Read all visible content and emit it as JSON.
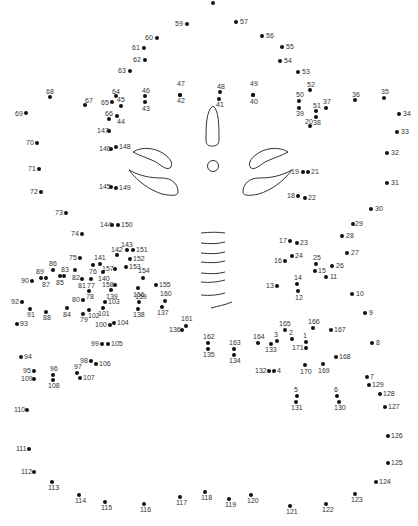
{
  "puzzle": {
    "type": "connect-the-dots",
    "line_color": "#333333",
    "dot_color": "#111111",
    "points": [
      {
        "n": "",
        "x": 213,
        "y": 3,
        "lx": 0,
        "ly": 0
      },
      {
        "n": "57",
        "x": 236,
        "y": 22,
        "lx": 4,
        "ly": -4
      },
      {
        "n": "59",
        "x": 187,
        "y": 24,
        "lx": -12,
        "ly": -4
      },
      {
        "n": "56",
        "x": 262,
        "y": 36,
        "lx": 4,
        "ly": -4
      },
      {
        "n": "60",
        "x": 157,
        "y": 38,
        "lx": -12,
        "ly": -4
      },
      {
        "n": "55",
        "x": 282,
        "y": 47,
        "lx": 4,
        "ly": -4
      },
      {
        "n": "61",
        "x": 144,
        "y": 48,
        "lx": -12,
        "ly": -4
      },
      {
        "n": "62",
        "x": 145,
        "y": 60,
        "lx": -12,
        "ly": -4
      },
      {
        "n": "54",
        "x": 280,
        "y": 61,
        "lx": 4,
        "ly": -4
      },
      {
        "n": "63",
        "x": 130,
        "y": 71,
        "lx": -12,
        "ly": -4
      },
      {
        "n": "53",
        "x": 298,
        "y": 72,
        "lx": 4,
        "ly": -4
      },
      {
        "n": "47",
        "x": 180,
        "y": 95,
        "lx": -3,
        "ly": -15
      },
      {
        "n": "42",
        "x": 180,
        "y": 95,
        "lx": -3,
        "ly": 2
      },
      {
        "n": "48",
        "x": 220,
        "y": 92,
        "lx": -3,
        "ly": -9
      },
      {
        "n": "41",
        "x": 219,
        "y": 99,
        "lx": -3,
        "ly": 2
      },
      {
        "n": "49",
        "x": 253,
        "y": 95,
        "lx": -3,
        "ly": -15
      },
      {
        "n": "40",
        "x": 253,
        "y": 95,
        "lx": -3,
        "ly": 3
      },
      {
        "n": "68",
        "x": 50,
        "y": 97,
        "lx": -4,
        "ly": -9
      },
      {
        "n": "64",
        "x": 116,
        "y": 96,
        "lx": -4,
        "ly": -8
      },
      {
        "n": "46",
        "x": 145,
        "y": 96,
        "lx": -3,
        "ly": -9
      },
      {
        "n": "43",
        "x": 145,
        "y": 102,
        "lx": -3,
        "ly": 3
      },
      {
        "n": "67",
        "x": 85,
        "y": 105,
        "lx": 0,
        "ly": -8
      },
      {
        "n": "65",
        "x": 112,
        "y": 102,
        "lx": -11,
        "ly": -3
      },
      {
        "n": "45",
        "x": 121,
        "y": 106,
        "lx": -4,
        "ly": -10
      },
      {
        "n": "66",
        "x": 109,
        "y": 119,
        "lx": -4,
        "ly": -9
      },
      {
        "n": "44",
        "x": 117,
        "y": 116,
        "lx": 0,
        "ly": 2
      },
      {
        "n": "69",
        "x": 26,
        "y": 113,
        "lx": -11,
        "ly": -3
      },
      {
        "n": "52",
        "x": 310,
        "y": 90,
        "lx": -3,
        "ly": -9
      },
      {
        "n": "50",
        "x": 299,
        "y": 101,
        "lx": -3,
        "ly": -10
      },
      {
        "n": "39",
        "x": 299,
        "y": 108,
        "lx": -3,
        "ly": 2
      },
      {
        "n": "51",
        "x": 316,
        "y": 111,
        "lx": -3,
        "ly": -9
      },
      {
        "n": "37",
        "x": 326,
        "y": 108,
        "lx": -3,
        "ly": -10
      },
      {
        "n": "36",
        "x": 355,
        "y": 100,
        "lx": -3,
        "ly": -9
      },
      {
        "n": "35",
        "x": 384,
        "y": 98,
        "lx": -3,
        "ly": -10
      },
      {
        "n": "38",
        "x": 316,
        "y": 117,
        "lx": -3,
        "ly": 2
      },
      {
        "n": "20",
        "x": 310,
        "y": 126,
        "lx": -5,
        "ly": -8
      },
      {
        "n": "34",
        "x": 399,
        "y": 114,
        "lx": 4,
        "ly": -4
      },
      {
        "n": "147",
        "x": 109,
        "y": 131,
        "lx": -12,
        "ly": -4
      },
      {
        "n": "33",
        "x": 397,
        "y": 132,
        "lx": 4,
        "ly": -4
      },
      {
        "n": "70",
        "x": 37,
        "y": 143,
        "lx": -11,
        "ly": -4
      },
      {
        "n": "146",
        "x": 111,
        "y": 149,
        "lx": -12,
        "ly": -4
      },
      {
        "n": "148",
        "x": 116,
        "y": 147,
        "lx": 3,
        "ly": -4
      },
      {
        "n": "32",
        "x": 387,
        "y": 153,
        "lx": 4,
        "ly": -4
      },
      {
        "n": "71",
        "x": 39,
        "y": 169,
        "lx": -11,
        "ly": -4
      },
      {
        "n": "19",
        "x": 303,
        "y": 172,
        "lx": -12,
        "ly": -4
      },
      {
        "n": "21",
        "x": 308,
        "y": 172,
        "lx": 3,
        "ly": -4
      },
      {
        "n": "145",
        "x": 111,
        "y": 187,
        "lx": -12,
        "ly": -4
      },
      {
        "n": "149",
        "x": 116,
        "y": 188,
        "lx": 3,
        "ly": -4
      },
      {
        "n": "31",
        "x": 387,
        "y": 183,
        "lx": 4,
        "ly": -4
      },
      {
        "n": "72",
        "x": 41,
        "y": 192,
        "lx": -11,
        "ly": -4
      },
      {
        "n": "18",
        "x": 298,
        "y": 196,
        "lx": -11,
        "ly": -4
      },
      {
        "n": "22",
        "x": 305,
        "y": 198,
        "lx": 3,
        "ly": -4
      },
      {
        "n": "30",
        "x": 371,
        "y": 209,
        "lx": 4,
        "ly": -4
      },
      {
        "n": "73",
        "x": 66,
        "y": 213,
        "lx": -11,
        "ly": -4
      },
      {
        "n": "144",
        "x": 112,
        "y": 225,
        "lx": -12,
        "ly": -4
      },
      {
        "n": "150",
        "x": 118,
        "y": 225,
        "lx": 3,
        "ly": -4
      },
      {
        "n": "29",
        "x": 353,
        "y": 224,
        "lx": 2,
        "ly": -4
      },
      {
        "n": "74",
        "x": 82,
        "y": 234,
        "lx": -11,
        "ly": -4
      },
      {
        "n": "28",
        "x": 342,
        "y": 236,
        "lx": 4,
        "ly": -4
      },
      {
        "n": "17",
        "x": 290,
        "y": 241,
        "lx": -11,
        "ly": -4
      },
      {
        "n": "23",
        "x": 297,
        "y": 243,
        "lx": 3,
        "ly": -4
      },
      {
        "n": "143",
        "x": 127,
        "y": 250,
        "lx": -6,
        "ly": -9
      },
      {
        "n": "151",
        "x": 133,
        "y": 250,
        "lx": 3,
        "ly": -4
      },
      {
        "n": "27",
        "x": 347,
        "y": 253,
        "lx": 4,
        "ly": -4
      },
      {
        "n": "75",
        "x": 80,
        "y": 258,
        "lx": -11,
        "ly": -4
      },
      {
        "n": "142",
        "x": 117,
        "y": 255,
        "lx": -6,
        "ly": -9
      },
      {
        "n": "152",
        "x": 130,
        "y": 259,
        "lx": 3,
        "ly": -4
      },
      {
        "n": "141",
        "x": 100,
        "y": 264,
        "lx": -6,
        "ly": -10
      },
      {
        "n": "16",
        "x": 285,
        "y": 261,
        "lx": -11,
        "ly": -4
      },
      {
        "n": "24",
        "x": 292,
        "y": 256,
        "lx": 3,
        "ly": -4
      },
      {
        "n": "25",
        "x": 316,
        "y": 264,
        "lx": -3,
        "ly": -10
      },
      {
        "n": "26",
        "x": 332,
        "y": 266,
        "lx": 4,
        "ly": -4
      },
      {
        "n": "86",
        "x": 53,
        "y": 270,
        "lx": -4,
        "ly": -10
      },
      {
        "n": "76",
        "x": 93,
        "y": 265,
        "lx": -4,
        "ly": 3
      },
      {
        "n": "157",
        "x": 115,
        "y": 269,
        "lx": -13,
        "ly": -4
      },
      {
        "n": "153",
        "x": 126,
        "y": 267,
        "lx": 3,
        "ly": -4
      },
      {
        "n": "15",
        "x": 315,
        "y": 271,
        "lx": 3,
        "ly": -4
      },
      {
        "n": "89",
        "x": 41,
        "y": 278,
        "lx": -5,
        "ly": -10
      },
      {
        "n": "83",
        "x": 64,
        "y": 276,
        "lx": -3,
        "ly": -10
      },
      {
        "n": "82",
        "x": 75,
        "y": 270,
        "lx": -3,
        "ly": 4
      },
      {
        "n": "140",
        "x": 103,
        "y": 272,
        "lx": -5,
        "ly": 3
      },
      {
        "n": "11",
        "x": 326,
        "y": 277,
        "lx": 4,
        "ly": -4
      },
      {
        "n": "90",
        "x": 32,
        "y": 281,
        "lx": -11,
        "ly": -4
      },
      {
        "n": "87",
        "x": 46,
        "y": 278,
        "lx": -4,
        "ly": 3
      },
      {
        "n": "85",
        "x": 60,
        "y": 276,
        "lx": -4,
        "ly": 3
      },
      {
        "n": "81",
        "x": 82,
        "y": 279,
        "lx": -4,
        "ly": 3
      },
      {
        "n": "77",
        "x": 91,
        "y": 279,
        "lx": -4,
        "ly": 3
      },
      {
        "n": "154",
        "x": 143,
        "y": 278,
        "lx": -5,
        "ly": -11
      },
      {
        "n": "158",
        "x": 115,
        "y": 285,
        "lx": -13,
        "ly": -4
      },
      {
        "n": "155",
        "x": 156,
        "y": 285,
        "lx": 3,
        "ly": -4
      },
      {
        "n": "13",
        "x": 277,
        "y": 286,
        "lx": -11,
        "ly": -4
      },
      {
        "n": "14",
        "x": 297,
        "y": 284,
        "lx": -3,
        "ly": -10
      },
      {
        "n": "78",
        "x": 89,
        "y": 291,
        "lx": -3,
        "ly": 2
      },
      {
        "n": "139",
        "x": 111,
        "y": 290,
        "lx": -5,
        "ly": 3
      },
      {
        "n": "156",
        "x": 138,
        "y": 288,
        "lx": -5,
        "ly": 3
      },
      {
        "n": "12",
        "x": 298,
        "y": 291,
        "lx": -3,
        "ly": 3
      },
      {
        "n": "10",
        "x": 352,
        "y": 294,
        "lx": 4,
        "ly": -4
      },
      {
        "n": "159",
        "x": 139,
        "y": 302,
        "lx": -4,
        "ly": -9
      },
      {
        "n": "160",
        "x": 165,
        "y": 301,
        "lx": -5,
        "ly": -11
      },
      {
        "n": "80",
        "x": 83,
        "y": 300,
        "lx": -11,
        "ly": -4
      },
      {
        "n": "103",
        "x": 105,
        "y": 302,
        "lx": 3,
        "ly": -4
      },
      {
        "n": "92",
        "x": 22,
        "y": 302,
        "lx": -11,
        "ly": -4
      },
      {
        "n": "84",
        "x": 67,
        "y": 308,
        "lx": -4,
        "ly": 3
      },
      {
        "n": "91",
        "x": 30,
        "y": 309,
        "lx": -3,
        "ly": 2
      },
      {
        "n": "88",
        "x": 46,
        "y": 312,
        "lx": -3,
        "ly": 2
      },
      {
        "n": "79",
        "x": 83,
        "y": 314,
        "lx": -3,
        "ly": 2
      },
      {
        "n": "102",
        "x": 89,
        "y": 310,
        "lx": -1,
        "ly": 2
      },
      {
        "n": "101",
        "x": 103,
        "y": 308,
        "lx": -5,
        "ly": 2
      },
      {
        "n": "138",
        "x": 138,
        "y": 309,
        "lx": -5,
        "ly": 2
      },
      {
        "n": "137",
        "x": 162,
        "y": 307,
        "lx": -5,
        "ly": 2
      },
      {
        "n": "9",
        "x": 365,
        "y": 313,
        "lx": 4,
        "ly": -4
      },
      {
        "n": "93",
        "x": 17,
        "y": 324,
        "lx": 3,
        "ly": -4
      },
      {
        "n": "100",
        "x": 110,
        "y": 325,
        "lx": -15,
        "ly": -4
      },
      {
        "n": "104",
        "x": 114,
        "y": 323,
        "lx": 3,
        "ly": -4
      },
      {
        "n": "161",
        "x": 186,
        "y": 326,
        "lx": -5,
        "ly": -11
      },
      {
        "n": "136",
        "x": 182,
        "y": 330,
        "lx": -13,
        "ly": -4
      },
      {
        "n": "165",
        "x": 285,
        "y": 330,
        "lx": -6,
        "ly": -10
      },
      {
        "n": "166",
        "x": 313,
        "y": 328,
        "lx": -5,
        "ly": -10
      },
      {
        "n": "167",
        "x": 331,
        "y": 330,
        "lx": 3,
        "ly": -4
      },
      {
        "n": "162",
        "x": 208,
        "y": 343,
        "lx": -5,
        "ly": -10
      },
      {
        "n": "135",
        "x": 208,
        "y": 349,
        "lx": -5,
        "ly": 2
      },
      {
        "n": "163",
        "x": 234,
        "y": 349,
        "lx": -5,
        "ly": -10
      },
      {
        "n": "134",
        "x": 234,
        "y": 355,
        "lx": -5,
        "ly": 2
      },
      {
        "n": "164",
        "x": 258,
        "y": 343,
        "lx": -5,
        "ly": -10
      },
      {
        "n": "3",
        "x": 277,
        "y": 341,
        "lx": -3,
        "ly": -10
      },
      {
        "n": "133",
        "x": 271,
        "y": 344,
        "lx": -6,
        "ly": 2
      },
      {
        "n": "2",
        "x": 292,
        "y": 339,
        "lx": -3,
        "ly": -10
      },
      {
        "n": "1",
        "x": 306,
        "y": 342,
        "lx": -3,
        "ly": -10
      },
      {
        "n": "171",
        "x": 306,
        "y": 348,
        "lx": -14,
        "ly": -4
      },
      {
        "n": "8",
        "x": 372,
        "y": 343,
        "lx": 4,
        "ly": -4
      },
      {
        "n": "99",
        "x": 102,
        "y": 344,
        "lx": -11,
        "ly": -4
      },
      {
        "n": "105",
        "x": 108,
        "y": 344,
        "lx": 3,
        "ly": -4
      },
      {
        "n": "94",
        "x": 21,
        "y": 357,
        "lx": 3,
        "ly": -4
      },
      {
        "n": "168",
        "x": 336,
        "y": 357,
        "lx": 3,
        "ly": -4
      },
      {
        "n": "98",
        "x": 91,
        "y": 361,
        "lx": -11,
        "ly": -4
      },
      {
        "n": "106",
        "x": 96,
        "y": 364,
        "lx": 3,
        "ly": -4
      },
      {
        "n": "95",
        "x": 34,
        "y": 371,
        "lx": -11,
        "ly": -4
      },
      {
        "n": "96",
        "x": 53,
        "y": 375,
        "lx": -3,
        "ly": -10
      },
      {
        "n": "97",
        "x": 77,
        "y": 373,
        "lx": -3,
        "ly": -10
      },
      {
        "n": "170",
        "x": 305,
        "y": 365,
        "lx": -5,
        "ly": 3
      },
      {
        "n": "169",
        "x": 323,
        "y": 364,
        "lx": -5,
        "ly": 3
      },
      {
        "n": "132",
        "x": 269,
        "y": 371,
        "lx": -14,
        "ly": -4
      },
      {
        "n": "4",
        "x": 274,
        "y": 371,
        "lx": 3,
        "ly": -4
      },
      {
        "n": "7",
        "x": 367,
        "y": 377,
        "lx": 3,
        "ly": -4
      },
      {
        "n": "109",
        "x": 34,
        "y": 379,
        "lx": -13,
        "ly": -4
      },
      {
        "n": "108",
        "x": 53,
        "y": 380,
        "lx": -5,
        "ly": 2
      },
      {
        "n": "107",
        "x": 80,
        "y": 378,
        "lx": 3,
        "ly": -4
      },
      {
        "n": "129",
        "x": 369,
        "y": 385,
        "lx": 3,
        "ly": -4
      },
      {
        "n": "5",
        "x": 297,
        "y": 396,
        "lx": -3,
        "ly": -10
      },
      {
        "n": "6",
        "x": 337,
        "y": 396,
        "lx": -3,
        "ly": -10
      },
      {
        "n": "128",
        "x": 380,
        "y": 394,
        "lx": 3,
        "ly": -4
      },
      {
        "n": "131",
        "x": 296,
        "y": 402,
        "lx": -5,
        "ly": 2
      },
      {
        "n": "130",
        "x": 339,
        "y": 402,
        "lx": -5,
        "ly": 2
      },
      {
        "n": "110",
        "x": 27,
        "y": 410,
        "lx": -13,
        "ly": -4
      },
      {
        "n": "127",
        "x": 385,
        "y": 407,
        "lx": 3,
        "ly": -4
      },
      {
        "n": "126",
        "x": 388,
        "y": 436,
        "lx": 3,
        "ly": -4
      },
      {
        "n": "111",
        "x": 29,
        "y": 449,
        "lx": -13,
        "ly": -4
      },
      {
        "n": "125",
        "x": 388,
        "y": 463,
        "lx": 3,
        "ly": -4
      },
      {
        "n": "112",
        "x": 34,
        "y": 472,
        "lx": -13,
        "ly": -4
      },
      {
        "n": "124",
        "x": 376,
        "y": 482,
        "lx": 3,
        "ly": -4
      },
      {
        "n": "113",
        "x": 52,
        "y": 482,
        "lx": -4,
        "ly": 2
      },
      {
        "n": "123",
        "x": 355,
        "y": 494,
        "lx": -4,
        "ly": 2
      },
      {
        "n": "118",
        "x": 205,
        "y": 492,
        "lx": -4,
        "ly": 2
      },
      {
        "n": "114",
        "x": 79,
        "y": 495,
        "lx": -4,
        "ly": 2
      },
      {
        "n": "117",
        "x": 180,
        "y": 497,
        "lx": -4,
        "ly": 2
      },
      {
        "n": "120",
        "x": 251,
        "y": 495,
        "lx": -4,
        "ly": 2
      },
      {
        "n": "119",
        "x": 229,
        "y": 499,
        "lx": -4,
        "ly": 2
      },
      {
        "n": "115",
        "x": 105,
        "y": 502,
        "lx": -4,
        "ly": 2
      },
      {
        "n": "116",
        "x": 144,
        "y": 504,
        "lx": -4,
        "ly": 2
      },
      {
        "n": "122",
        "x": 326,
        "y": 504,
        "lx": -4,
        "ly": 2
      },
      {
        "n": "121",
        "x": 290,
        "y": 506,
        "lx": -4,
        "ly": 2
      }
    ]
  }
}
